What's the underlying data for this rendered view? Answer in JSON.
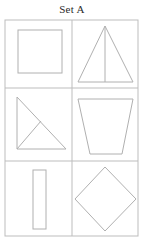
{
  "sheet": {
    "title": "Set A",
    "background_color": "#ffffff",
    "line_color": "#b0b0b0",
    "grid_line_color": "#bdbdbd",
    "title_color": "#2b2b2b",
    "columns": 2,
    "rows": 3,
    "cell_count": 6
  },
  "grid": {
    "left": 5,
    "top": 20,
    "right": 138,
    "bottom": 236,
    "vertical_divider_x": 72,
    "horizontal_divider_1_y": 88,
    "horizontal_divider_2_y": 161
  },
  "cells": [
    {
      "index": 1,
      "row": 1,
      "column": 1,
      "shape_name": "square",
      "shape_label": "Square",
      "internal_line": "none",
      "outline_color": "#b0b0b0",
      "fill": "none",
      "bounds": {
        "x": 18,
        "y": 30,
        "width": 44,
        "height": 43
      }
    },
    {
      "index": 2,
      "row": 1,
      "column": 2,
      "shape_name": "triangle-with-altitude",
      "shape_label": "Triangle with altitude",
      "internal_line": "vertical altitude from apex to base midpoint",
      "outline_color": "#b0b0b0",
      "fill": "none",
      "points": "105,26 133,82 78,82",
      "altitude": {
        "x1": 105,
        "y1": 26,
        "x2": 105,
        "y2": 82
      }
    },
    {
      "index": 3,
      "row": 2,
      "column": 1,
      "shape_name": "right-triangle-with-cevian",
      "shape_label": "Right triangle with internal line",
      "internal_line": "line from bottom-left vertex to point on hypotenuse",
      "outline_color": "#b0b0b0",
      "fill": "none",
      "points": "17,97 17,149 66,149",
      "cevian": {
        "x1": 17,
        "y1": 149,
        "x2": 41,
        "y2": 121
      }
    },
    {
      "index": 4,
      "row": 2,
      "column": 2,
      "shape_name": "trapezoid",
      "shape_label": "Trapezoid",
      "internal_line": "none",
      "outline_color": "#b0b0b0",
      "fill": "none",
      "points": "78,99 133,99 122,154 90,154"
    },
    {
      "index": 5,
      "row": 3,
      "column": 1,
      "shape_name": "vertical-rectangle",
      "shape_label": "Narrow vertical rectangle",
      "internal_line": "none",
      "outline_color": "#b0b0b0",
      "fill": "none",
      "bounds": {
        "x": 33,
        "y": 170,
        "width": 13,
        "height": 59
      }
    },
    {
      "index": 6,
      "row": 3,
      "column": 2,
      "shape_name": "diamond",
      "shape_label": "Diamond (rotated square)",
      "internal_line": "none",
      "outline_color": "#b0b0b0",
      "fill": "none",
      "points": "105,167 136,199 105,231 75,199"
    }
  ]
}
